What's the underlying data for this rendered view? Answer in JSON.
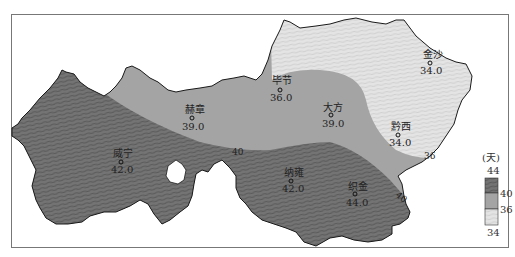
{
  "map": {
    "type": "isoline choropleth",
    "unit": "(天)",
    "stations": [
      {
        "name": "金沙",
        "value": "34.0"
      },
      {
        "name": "毕节",
        "value": "36.0"
      },
      {
        "name": "赫章",
        "value": "39.0"
      },
      {
        "name": "大方",
        "value": "39.0"
      },
      {
        "name": "黔西",
        "value": "34.0"
      },
      {
        "name": "威宁",
        "value": "42.0"
      },
      {
        "name": "纳雍",
        "value": "42.0"
      },
      {
        "name": "织金",
        "value": "44.0"
      }
    ],
    "contours": [
      {
        "label": "40"
      },
      {
        "label": "36"
      },
      {
        "label": "40"
      }
    ],
    "legend": {
      "unit": "(天)",
      "ticks": [
        "44",
        "40",
        "36",
        "34"
      ],
      "classes": [
        {
          "range": "40-44",
          "color": "#6e6e6e"
        },
        {
          "range": "36-40",
          "color": "#a3a3a3"
        },
        {
          "range": "34-36",
          "color": "#dcdcdc"
        }
      ]
    },
    "colors": {
      "high": "#6e6e6e",
      "mid": "#a3a3a3",
      "low": "#dcdcdc",
      "outline": "#1a1a1a"
    }
  }
}
